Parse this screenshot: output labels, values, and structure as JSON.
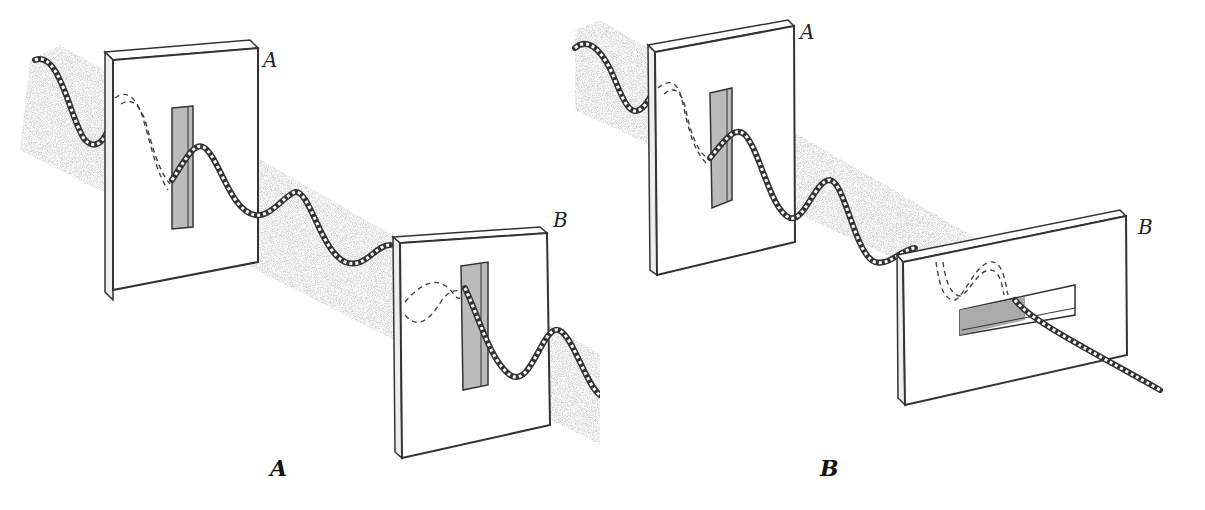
{
  "figure": {
    "panels": [
      {
        "id": "A",
        "caption": "A",
        "filters": [
          {
            "label": "A",
            "slit_orientation": "vertical"
          },
          {
            "label": "B",
            "slit_orientation": "vertical"
          }
        ],
        "outcome": "wave passes through both slits"
      },
      {
        "id": "B",
        "caption": "B",
        "filters": [
          {
            "label": "A",
            "slit_orientation": "vertical"
          },
          {
            "label": "B",
            "slit_orientation": "horizontal"
          }
        ],
        "outcome": "wave blocked by crossed slit"
      }
    ]
  },
  "colors": {
    "ink": "#222222",
    "shadow": "#9a9a9a",
    "paper": "#ffffff"
  }
}
